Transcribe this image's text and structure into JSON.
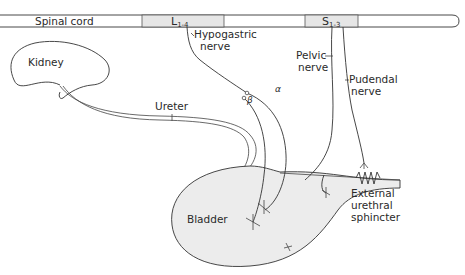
{
  "diagram": {
    "spinal_cord": {
      "label": "Spinal cord",
      "segments": [
        {
          "id": "lumbar",
          "letter": "L",
          "range": "1-4"
        },
        {
          "id": "sacral",
          "letter": "S",
          "range": "1-3"
        }
      ]
    },
    "organs": {
      "kidney": "Kidney",
      "ureter": "Ureter",
      "bladder": "Bladder"
    },
    "nerves": {
      "hypogastric": [
        "Hypogastric",
        "nerve"
      ],
      "pelvic": [
        "Pelvic",
        "nerve"
      ],
      "pudendal": [
        "Pudendal",
        "nerve"
      ],
      "alpha": "α",
      "beta": "β"
    },
    "sphincter": [
      "External",
      "urethral",
      "sphincter"
    ],
    "colors": {
      "line": "#333333",
      "segment_fill": "#e6e6e6",
      "bladder_fill": "#ececec",
      "background": "#ffffff"
    }
  }
}
